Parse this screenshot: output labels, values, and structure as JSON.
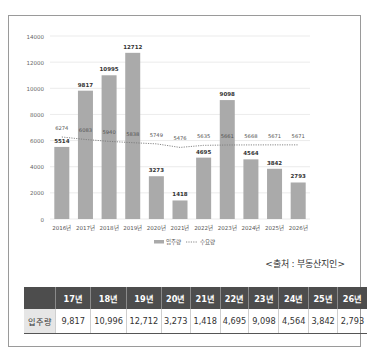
{
  "chart_data": {
    "type": "bar",
    "title": "",
    "xlabel": "",
    "ylabel": "",
    "ylim": [
      0,
      14000
    ],
    "yticks": [
      0,
      2000,
      4000,
      6000,
      8000,
      10000,
      12000,
      14000
    ],
    "grid": true,
    "legend_position": "bottom",
    "categories": [
      "2016년",
      "2017년",
      "2018년",
      "2019년",
      "2020년",
      "2021년",
      "2022년",
      "2023년",
      "2024년",
      "2025년",
      "2026년"
    ],
    "series": [
      {
        "name": "입주량",
        "type": "bar",
        "color": "#aaaaaa",
        "values": [
          5514,
          9817,
          10995,
          12712,
          3273,
          1418,
          4695,
          9098,
          4564,
          3842,
          2793
        ]
      },
      {
        "name": "수요량",
        "type": "line",
        "style": "dotted",
        "color": "#7a7a7a",
        "values": [
          6274,
          6083,
          5940,
          5838,
          5749,
          5476,
          5635,
          5661,
          5668,
          5671,
          5671
        ]
      }
    ]
  },
  "source": "<출처 : 부동산지인>",
  "table": {
    "headers": [
      "",
      "17년",
      "18년",
      "19년",
      "20년",
      "21년",
      "22년",
      "23년",
      "24년",
      "25년",
      "26년"
    ],
    "row_label": "입주량",
    "values": [
      "9,817",
      "10,996",
      "12,712",
      "3,273",
      "1,418",
      "4,695",
      "9,098",
      "4,564",
      "3,842",
      "2,793"
    ]
  }
}
